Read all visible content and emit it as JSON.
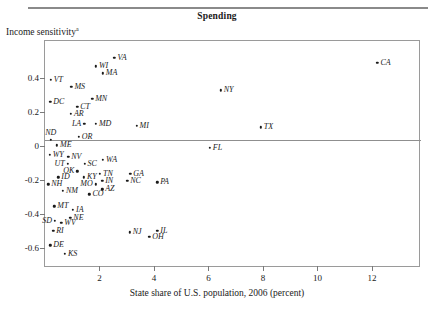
{
  "figure": {
    "title": "Spending",
    "y_axis_label": "Income sensitivity",
    "y_axis_label_superscript": "a",
    "x_axis_label": "State share of U.S. population, 2006 (percent)"
  },
  "chart_data": {
    "type": "scatter",
    "title": "Spending",
    "xlabel": "State share of U.S. population, 2006 (percent)",
    "ylabel": "Income sensitivity",
    "xlim": [
      0.0,
      13.8
    ],
    "ylim": [
      -0.72,
      0.62
    ],
    "xticks": [
      2,
      4,
      6,
      8,
      10,
      12
    ],
    "yticks": [
      0.4,
      0.2,
      0,
      -0.2,
      -0.4,
      -0.6
    ],
    "xtick_labels": [
      "2",
      "4",
      "6",
      "8",
      "10",
      "12"
    ],
    "ytick_labels": [
      "0.4",
      "0.2",
      "0",
      "-0.2",
      "-0.4",
      "-0.6"
    ],
    "grid": false,
    "legend": null,
    "zero_line": 0,
    "point_label_style": "italic state abbreviation",
    "points": [
      {
        "label": "VA",
        "x": 2.55,
        "y": 0.52,
        "pos": "r"
      },
      {
        "label": "WI",
        "x": 1.87,
        "y": 0.47,
        "pos": "r"
      },
      {
        "label": "CA",
        "x": 12.2,
        "y": 0.49,
        "pos": "r"
      },
      {
        "label": "MA",
        "x": 2.12,
        "y": 0.43,
        "pos": "r"
      },
      {
        "label": "VT",
        "x": 0.21,
        "y": 0.39,
        "pos": "r"
      },
      {
        "label": "MS",
        "x": 0.97,
        "y": 0.35,
        "pos": "r"
      },
      {
        "label": "NY",
        "x": 6.45,
        "y": 0.33,
        "pos": "r"
      },
      {
        "label": "MN",
        "x": 1.73,
        "y": 0.28,
        "pos": "r"
      },
      {
        "label": "DC",
        "x": 0.19,
        "y": 0.26,
        "pos": "r"
      },
      {
        "label": "CT",
        "x": 1.18,
        "y": 0.23,
        "pos": "r"
      },
      {
        "label": "AR",
        "x": 0.95,
        "y": 0.19,
        "pos": "r"
      },
      {
        "label": "MD",
        "x": 1.87,
        "y": 0.13,
        "pos": "r"
      },
      {
        "label": "LA",
        "x": 1.44,
        "y": 0.13,
        "pos": "l"
      },
      {
        "label": "MI",
        "x": 3.36,
        "y": 0.12,
        "pos": "r"
      },
      {
        "label": "TX",
        "x": 7.92,
        "y": 0.11,
        "pos": "r"
      },
      {
        "label": "OR",
        "x": 1.24,
        "y": 0.055,
        "pos": "r"
      },
      {
        "label": "ND",
        "x": 0.21,
        "y": 0.035,
        "pos": "a"
      },
      {
        "label": "ME",
        "x": 0.44,
        "y": 0.005,
        "pos": "r"
      },
      {
        "label": "FL",
        "x": 6.05,
        "y": -0.01,
        "pos": "r"
      },
      {
        "label": "WY",
        "x": 0.17,
        "y": -0.05,
        "pos": "r"
      },
      {
        "label": "NV",
        "x": 0.85,
        "y": -0.065,
        "pos": "r"
      },
      {
        "label": "WA",
        "x": 2.13,
        "y": -0.08,
        "pos": "r"
      },
      {
        "label": "SC",
        "x": 1.45,
        "y": -0.105,
        "pos": "r"
      },
      {
        "label": "UT",
        "x": 0.83,
        "y": -0.105,
        "pos": "l"
      },
      {
        "label": "OK",
        "x": 1.19,
        "y": -0.15,
        "pos": "l"
      },
      {
        "label": "TN",
        "x": 2.02,
        "y": -0.165,
        "pos": "r"
      },
      {
        "label": "GA",
        "x": 3.13,
        "y": -0.165,
        "pos": "r"
      },
      {
        "label": "KY",
        "x": 1.43,
        "y": -0.185,
        "pos": "r"
      },
      {
        "label": "ID",
        "x": 0.49,
        "y": -0.185,
        "pos": "r"
      },
      {
        "label": "NC",
        "x": 3.02,
        "y": -0.205,
        "pos": "r"
      },
      {
        "label": "PA",
        "x": 4.12,
        "y": -0.215,
        "pos": "r"
      },
      {
        "label": "IN",
        "x": 2.1,
        "y": -0.205,
        "pos": "r"
      },
      {
        "label": "MO",
        "x": 1.86,
        "y": -0.225,
        "pos": "l"
      },
      {
        "label": "AZ",
        "x": 2.1,
        "y": -0.255,
        "pos": "r"
      },
      {
        "label": "NH",
        "x": 0.12,
        "y": -0.225,
        "pos": "r"
      },
      {
        "label": "NM",
        "x": 0.66,
        "y": -0.265,
        "pos": "r"
      },
      {
        "label": "CO",
        "x": 1.63,
        "y": -0.285,
        "pos": "r"
      },
      {
        "label": "MT",
        "x": 0.34,
        "y": -0.355,
        "pos": "r"
      },
      {
        "label": "IA",
        "x": 1.03,
        "y": -0.375,
        "pos": "r"
      },
      {
        "label": "NE",
        "x": 0.93,
        "y": -0.425,
        "pos": "r"
      },
      {
        "label": "SD",
        "x": 0.37,
        "y": -0.44,
        "pos": "l"
      },
      {
        "label": "WV",
        "x": 0.6,
        "y": -0.455,
        "pos": "r"
      },
      {
        "label": "RI",
        "x": 0.3,
        "y": -0.5,
        "pos": "r"
      },
      {
        "label": "NJ",
        "x": 3.11,
        "y": -0.51,
        "pos": "r"
      },
      {
        "label": "IL",
        "x": 4.12,
        "y": -0.5,
        "pos": "r"
      },
      {
        "label": "OH",
        "x": 3.83,
        "y": -0.535,
        "pos": "r"
      },
      {
        "label": "DE",
        "x": 0.19,
        "y": -0.585,
        "pos": "r"
      },
      {
        "label": "KS",
        "x": 0.73,
        "y": -0.635,
        "pos": "r"
      }
    ]
  }
}
